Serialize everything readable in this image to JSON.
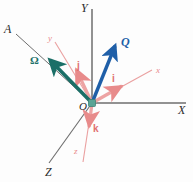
{
  "figure": {
    "kind": "vector-diagram",
    "background_color": "#fdfdfd",
    "origin": {
      "label": "O",
      "x": 92,
      "y": 103,
      "marker_color": "#5aa394"
    },
    "colors": {
      "global_axis": "#6e6e6e",
      "body_axis": "#e98c8c",
      "unit_vector": "#e98c8c",
      "omega_vector": "#1b6f67",
      "q_vector": "#1f5fa8",
      "label_dark": "#2b2b2b"
    },
    "global_axes": [
      {
        "name": "Y",
        "label": "Y",
        "label_x": 81,
        "label_y": 2,
        "from": [
          92,
          103
        ],
        "to": [
          92,
          9
        ]
      },
      {
        "name": "X",
        "label": "X",
        "label_x": 178,
        "label_y": 104,
        "from": [
          92,
          103
        ],
        "to": [
          186,
          103
        ]
      },
      {
        "name": "Z",
        "label": "Z",
        "label_x": 45,
        "label_y": 166,
        "from": [
          92,
          103
        ],
        "to": [
          49,
          163
        ]
      }
    ],
    "reference_line": {
      "name": "A",
      "label": "A",
      "label_x": 4,
      "label_y": 23,
      "from": [
        92,
        103
      ],
      "to": [
        16,
        34
      ]
    },
    "body_axes": [
      {
        "name": "x",
        "label": "x",
        "label_x": 156,
        "label_y": 66,
        "from": [
          92,
          103
        ],
        "to": [
          152,
          70
        ]
      },
      {
        "name": "y",
        "label": "y",
        "label_x": 48,
        "label_y": 34,
        "from": [
          92,
          103
        ],
        "to": [
          55,
          42
        ]
      },
      {
        "name": "z",
        "label": "z",
        "label_x": 74,
        "label_y": 147,
        "from": [
          92,
          103
        ],
        "to": [
          83,
          162
        ]
      }
    ],
    "unit_vectors": [
      {
        "name": "i",
        "label": "i",
        "label_x": 112,
        "label_y": 74,
        "from": [
          92,
          103
        ],
        "to": [
          124,
          85
        ]
      },
      {
        "name": "j",
        "label": "j",
        "label_x": 77,
        "label_y": 61,
        "from": [
          92,
          103
        ],
        "to": [
          74,
          66
        ]
      },
      {
        "name": "k",
        "label": "k",
        "label_x": 93,
        "label_y": 124,
        "from": [
          92,
          103
        ],
        "to": [
          88,
          130
        ]
      }
    ],
    "vectors": [
      {
        "name": "Omega",
        "label": "Ω",
        "label_x": 30,
        "label_y": 55,
        "from": [
          92,
          103
        ],
        "to": [
          47,
          57
        ],
        "color": "#1b6f67",
        "width": 3.6
      },
      {
        "name": "Q",
        "label": "Q",
        "label_x": 121,
        "label_y": 36,
        "from": [
          92,
          103
        ],
        "to": [
          117,
          43
        ],
        "color": "#1f5fa8",
        "width": 3.4
      }
    ]
  }
}
